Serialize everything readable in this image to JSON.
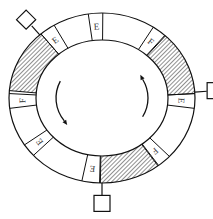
{
  "diagram": {
    "type": "ring-buffer",
    "colors": {
      "line": "#111111",
      "background": "#ffffff",
      "hatch": "#222222"
    },
    "ring": {
      "cx": 102,
      "cy": 98,
      "outer_rx": 93,
      "outer_ry": 85,
      "inner_rx": 66,
      "inner_ry": 58
    },
    "segments": [
      {
        "label": "E",
        "angle": -4,
        "width": 9,
        "kind": "label"
      },
      {
        "label": "F",
        "angle": 38,
        "width": 9,
        "kind": "label"
      },
      {
        "label": "",
        "angle": 65,
        "width": 44,
        "kind": "hatched"
      },
      {
        "label": "E",
        "angle": 92,
        "width": 10,
        "kind": "label"
      },
      {
        "label": "F",
        "angle": 138,
        "width": 9,
        "kind": "label"
      },
      {
        "label": "",
        "angle": 162,
        "width": 38,
        "kind": "hatched"
      },
      {
        "label": "E",
        "angle": 187,
        "width": 11,
        "kind": "label"
      },
      {
        "label": "E",
        "angle": 232,
        "width": 9,
        "kind": "label"
      },
      {
        "label": "F",
        "angle": 268,
        "width": 10,
        "kind": "label"
      },
      {
        "label": "",
        "angle": 297,
        "width": 44,
        "kind": "hatched"
      },
      {
        "label": "E",
        "angle": 324,
        "width": 10,
        "kind": "label"
      }
    ],
    "connectors": [
      {
        "name": "top-left-diamond",
        "angle": 318,
        "shape": "diamond"
      },
      {
        "name": "right-square",
        "angle": 86,
        "shape": "square"
      },
      {
        "name": "bottom-square",
        "angle": 180,
        "shape": "square"
      }
    ],
    "arrows": [
      {
        "name": "left-arrow",
        "direction": "counterclockwise",
        "side": "left"
      },
      {
        "name": "right-arrow",
        "direction": "counterclockwise",
        "side": "right"
      }
    ]
  }
}
